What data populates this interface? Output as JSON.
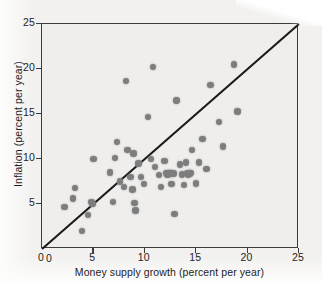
{
  "figure": {
    "background_color": "#f2f1ef",
    "plot_background_color": "#efeeec",
    "frame_color": "#3b3b3b",
    "marker_color": "#7d7d7d",
    "line_color": "#1a1a1a"
  },
  "chart_data": {
    "type": "scatter",
    "title": "",
    "xlabel": "Money supply growth (percent per year)",
    "ylabel": "Inflation (percent per year)",
    "xlim": [
      0,
      25
    ],
    "ylim": [
      0,
      25
    ],
    "xticks": [
      0,
      5,
      10,
      15,
      20,
      25
    ],
    "yticks": [
      0,
      5,
      10,
      15,
      20,
      25
    ],
    "xticklabels": [
      "0",
      "5",
      "10",
      "15",
      "20",
      "25"
    ],
    "yticklabels": [
      "0",
      "5",
      "10",
      "15",
      "20",
      "25"
    ],
    "grid": false,
    "legend": null,
    "reference_line": {
      "name": "forty-five-degree-line",
      "from": [
        0,
        0
      ],
      "to": [
        25,
        25
      ],
      "slope": 1,
      "intercept": 0
    },
    "series": [
      {
        "name": "countries",
        "marker": "circle",
        "color": "#7d7d7d",
        "points": [
          [
            2.2,
            4.7
          ],
          [
            3.0,
            5.6
          ],
          [
            3.2,
            6.8
          ],
          [
            3.9,
            2.0
          ],
          [
            4.5,
            3.8
          ],
          [
            4.8,
            5.2
          ],
          [
            4.9,
            5.0
          ],
          [
            5.0,
            10.0
          ],
          [
            6.6,
            8.5
          ],
          [
            6.9,
            5.2
          ],
          [
            7.1,
            10.1
          ],
          [
            7.3,
            11.9
          ],
          [
            7.6,
            7.5
          ],
          [
            8.0,
            6.9
          ],
          [
            8.2,
            18.7
          ],
          [
            8.3,
            11.0
          ],
          [
            8.6,
            8.0
          ],
          [
            8.8,
            6.6
          ],
          [
            8.9,
            10.6
          ],
          [
            9.0,
            5.1
          ],
          [
            9.1,
            4.3
          ],
          [
            9.4,
            9.5
          ],
          [
            9.6,
            8.0
          ],
          [
            9.9,
            7.2
          ],
          [
            10.3,
            14.7
          ],
          [
            10.6,
            10.0
          ],
          [
            10.8,
            20.2
          ],
          [
            11.0,
            9.1
          ],
          [
            11.4,
            8.2
          ],
          [
            11.6,
            6.9
          ],
          [
            11.9,
            9.8
          ],
          [
            12.2,
            8.3
          ],
          [
            12.4,
            8.4
          ],
          [
            12.6,
            7.2
          ],
          [
            12.8,
            8.4
          ],
          [
            12.9,
            3.9
          ],
          [
            13.1,
            16.5
          ],
          [
            13.4,
            9.4
          ],
          [
            13.6,
            8.3
          ],
          [
            13.8,
            7.1
          ],
          [
            14.0,
            9.6
          ],
          [
            14.2,
            8.3
          ],
          [
            14.4,
            8.4
          ],
          [
            14.6,
            11.0
          ],
          [
            15.0,
            7.3
          ],
          [
            15.3,
            9.6
          ],
          [
            15.6,
            12.2
          ],
          [
            16.0,
            8.9
          ],
          [
            16.4,
            18.2
          ],
          [
            17.2,
            14.1
          ],
          [
            17.6,
            11.4
          ],
          [
            18.7,
            20.5
          ],
          [
            19.0,
            15.3
          ]
        ],
        "wide_markers": [
          [
            12.3,
            8.4
          ],
          [
            14.3,
            8.4
          ]
        ]
      }
    ]
  }
}
